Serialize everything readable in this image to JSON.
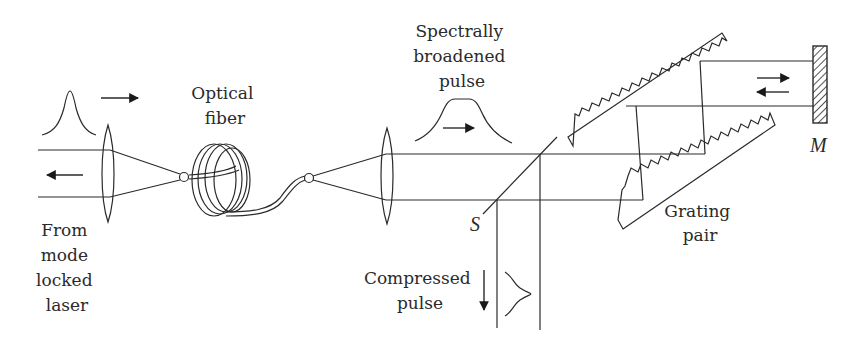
{
  "labels": {
    "source": [
      "From",
      "mode",
      "locked",
      "laser"
    ],
    "fiber": [
      "Optical",
      "fiber"
    ],
    "broadened": [
      "Spectrally",
      "broadened",
      "pulse"
    ],
    "compressed": [
      "Compressed",
      "pulse"
    ],
    "grating": [
      "Grating",
      "pair"
    ],
    "splitter": "S",
    "mirror": "M"
  },
  "colors": {
    "line": "#2a2a2a",
    "background": "#ffffff"
  }
}
